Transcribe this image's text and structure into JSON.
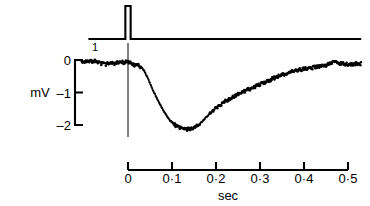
{
  "figure": {
    "caption_absent": true,
    "background_color": "#ffffff",
    "ink_color": "#000000"
  },
  "chart_data": {
    "type": "line",
    "title": "",
    "subtitle": "",
    "xlabel": "sec",
    "ylabel": "mV",
    "grid": false,
    "legend_position": "none",
    "xlim": [
      -0.105,
      0.53
    ],
    "ylim": [
      -2.35,
      0.35
    ],
    "xticks": [
      0,
      0.1,
      0.2,
      0.3,
      0.4,
      0.5
    ],
    "xtick_labels": [
      "0",
      "0·1",
      "0·2",
      "0·3",
      "0·4",
      "0·5"
    ],
    "yticks": [
      0,
      -1,
      -2
    ],
    "ytick_labels": [
      "0",
      "–1",
      "–2"
    ],
    "annotations": [
      {
        "name": "stimulus-marker-label",
        "text": "1",
        "x": -0.075,
        "y": 0.3
      }
    ],
    "marker_line": {
      "name": "time-zero-marker",
      "x": 0.0,
      "label": ""
    },
    "series": [
      {
        "name": "stimulus",
        "style": "step-pulse",
        "pulse_time": 0.0,
        "pulse_width": 0.012,
        "pulse_height": 1.0,
        "baseline": 0.0,
        "x_start": -0.09,
        "x_end": 0.53
      },
      {
        "name": "response",
        "style": "dotted-trace",
        "x": [
          -0.105,
          -0.1,
          -0.095,
          -0.09,
          -0.085,
          -0.08,
          -0.075,
          -0.07,
          -0.065,
          -0.06,
          -0.055,
          -0.05,
          -0.045,
          -0.04,
          -0.035,
          -0.03,
          -0.025,
          -0.02,
          -0.015,
          -0.01,
          -0.005,
          0.0,
          0.005,
          0.01,
          0.015,
          0.02,
          0.025,
          0.03,
          0.035,
          0.04,
          0.045,
          0.05,
          0.055,
          0.06,
          0.065,
          0.07,
          0.075,
          0.08,
          0.085,
          0.09,
          0.095,
          0.1,
          0.105,
          0.11,
          0.115,
          0.12,
          0.125,
          0.13,
          0.135,
          0.14,
          0.145,
          0.15,
          0.155,
          0.16,
          0.165,
          0.17,
          0.175,
          0.18,
          0.185,
          0.19,
          0.195,
          0.2,
          0.205,
          0.21,
          0.215,
          0.22,
          0.225,
          0.23,
          0.235,
          0.24,
          0.245,
          0.25,
          0.255,
          0.26,
          0.265,
          0.27,
          0.275,
          0.28,
          0.285,
          0.29,
          0.295,
          0.3,
          0.305,
          0.31,
          0.315,
          0.32,
          0.325,
          0.33,
          0.335,
          0.34,
          0.345,
          0.35,
          0.355,
          0.36,
          0.365,
          0.37,
          0.375,
          0.38,
          0.385,
          0.39,
          0.395,
          0.4,
          0.405,
          0.41,
          0.415,
          0.42,
          0.425,
          0.43,
          0.435,
          0.44,
          0.445,
          0.45,
          0.455,
          0.46,
          0.465,
          0.47,
          0.475,
          0.48,
          0.485,
          0.49,
          0.495,
          0.5,
          0.505,
          0.51,
          0.515,
          0.52,
          0.525,
          0.53
        ],
        "y": [
          -0.02,
          -0.05,
          -0.03,
          -0.08,
          -0.04,
          -0.07,
          -0.03,
          -0.09,
          -0.05,
          -0.12,
          -0.07,
          -0.14,
          -0.09,
          -0.11,
          -0.06,
          -0.13,
          -0.08,
          -0.1,
          -0.05,
          -0.09,
          -0.04,
          -0.07,
          -0.09,
          -0.12,
          -0.16,
          -0.14,
          -0.18,
          -0.22,
          -0.3,
          -0.42,
          -0.56,
          -0.72,
          -0.88,
          -1.02,
          -1.16,
          -1.3,
          -1.42,
          -1.54,
          -1.66,
          -1.76,
          -1.85,
          -1.92,
          -1.98,
          -2.03,
          -2.07,
          -2.1,
          -2.12,
          -2.13,
          -2.13,
          -2.12,
          -2.11,
          -2.09,
          -2.05,
          -2.0,
          -1.94,
          -1.87,
          -1.8,
          -1.73,
          -1.66,
          -1.6,
          -1.54,
          -1.48,
          -1.43,
          -1.38,
          -1.33,
          -1.28,
          -1.24,
          -1.2,
          -1.16,
          -1.12,
          -1.09,
          -1.05,
          -1.02,
          -0.99,
          -0.96,
          -0.93,
          -0.9,
          -0.87,
          -0.84,
          -0.81,
          -0.78,
          -0.75,
          -0.72,
          -0.69,
          -0.66,
          -0.63,
          -0.6,
          -0.57,
          -0.54,
          -0.51,
          -0.48,
          -0.46,
          -0.44,
          -0.42,
          -0.4,
          -0.38,
          -0.36,
          -0.34,
          -0.32,
          -0.3,
          -0.29,
          -0.28,
          -0.27,
          -0.26,
          -0.25,
          -0.23,
          -0.22,
          -0.21,
          -0.2,
          -0.19,
          -0.18,
          -0.17,
          -0.12,
          -0.08,
          -0.06,
          -0.05,
          -0.1,
          -0.12,
          -0.11,
          -0.13,
          -0.12,
          -0.14,
          -0.13,
          -0.15,
          -0.12,
          -0.1,
          -0.13,
          -0.11
        ]
      }
    ]
  }
}
